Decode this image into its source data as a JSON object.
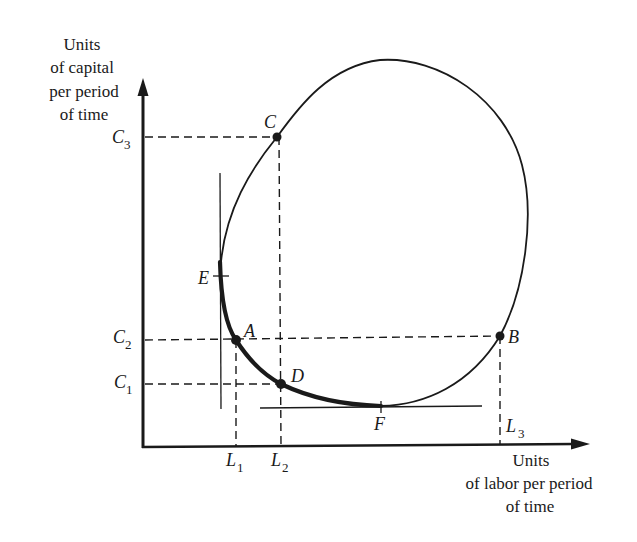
{
  "diagram": {
    "type": "isoquant-ridge-lines",
    "y_axis_title": [
      "Units",
      "of capital",
      "per period",
      "of time"
    ],
    "x_axis_title": [
      "Units",
      "of labor per period",
      "of time"
    ],
    "points": [
      {
        "id": "C",
        "label": "C"
      },
      {
        "id": "E",
        "label": "E"
      },
      {
        "id": "A",
        "label": "A"
      },
      {
        "id": "D",
        "label": "D"
      },
      {
        "id": "F",
        "label": "F"
      },
      {
        "id": "B",
        "label": "B"
      }
    ],
    "y_ticks": [
      {
        "main": "C",
        "sub": "3"
      },
      {
        "main": "C",
        "sub": "2"
      },
      {
        "main": "C",
        "sub": "1"
      }
    ],
    "x_ticks": [
      {
        "main": "L",
        "sub": "1"
      },
      {
        "main": "L",
        "sub": "2"
      },
      {
        "main": "L",
        "sub": "3"
      }
    ],
    "colors": {
      "ink": "#1a1a1a",
      "background": "#ffffff"
    }
  }
}
